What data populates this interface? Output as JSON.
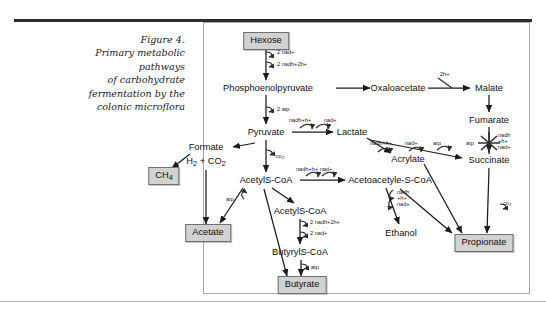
{
  "caption": {
    "figure_label": "Figure 4.",
    "lines": [
      "Figure 4.",
      "Primary metabolic",
      "pathways",
      "of carbohydrate",
      "fermentation by the",
      "colonic microflora"
    ]
  },
  "colors": {
    "box_fill": "#d2d2d2",
    "box_border": "#6f6f6f",
    "arrow": "#1b1b1b",
    "frame_border": "#a9a9a9",
    "top_rule": "#2b2b2b",
    "text": "#111111"
  },
  "diagram": {
    "title": "Primary metabolic pathways of carbohydrate fermentation by the colonic microflora",
    "nodes": [
      {
        "id": "hexose",
        "label": "Hexose",
        "style": "boxed",
        "x": 266,
        "y": 41
      },
      {
        "id": "pep",
        "label": "Phosphoenolpyruvate",
        "style": "plain",
        "x": 268,
        "y": 88
      },
      {
        "id": "oxaloacetate",
        "label": "Oxaloacetate",
        "style": "plain",
        "x": 398,
        "y": 88
      },
      {
        "id": "malate",
        "label": "Malate",
        "style": "plain",
        "x": 489,
        "y": 88
      },
      {
        "id": "fumarate",
        "label": "Fumarate",
        "style": "plain",
        "x": 489,
        "y": 120
      },
      {
        "id": "succinate",
        "label": "Succinate",
        "style": "plain",
        "x": 489,
        "y": 160
      },
      {
        "id": "pyruvate",
        "label": "Pyruvate",
        "style": "plain",
        "x": 266,
        "y": 132
      },
      {
        "id": "lactate",
        "label": "Lactate",
        "style": "plain",
        "x": 352,
        "y": 132
      },
      {
        "id": "acrylate",
        "label": "Acrylate",
        "style": "plain",
        "x": 408,
        "y": 159
      },
      {
        "id": "formate",
        "label": "Formate",
        "style": "plain",
        "x": 206,
        "y": 147
      },
      {
        "id": "h2co2",
        "label": "H2 + CO2",
        "style": "plain",
        "x": 206,
        "y": 160
      },
      {
        "id": "methane",
        "label": "CH4",
        "style": "boxed",
        "x": 164,
        "y": 176
      },
      {
        "id": "acetyl_coa",
        "label": "AcetylS-CoA",
        "style": "plain",
        "x": 266,
        "y": 180
      },
      {
        "id": "acetoacetyl_coa",
        "label": "Acetoacetyle-S-CoA",
        "style": "plain",
        "x": 390,
        "y": 180
      },
      {
        "id": "acetate",
        "label": "Acetate",
        "style": "boxed",
        "x": 208,
        "y": 233
      },
      {
        "id": "acetyl_coa_2",
        "label": "AcetylS-CoA",
        "style": "plain",
        "x": 300,
        "y": 211
      },
      {
        "id": "butyryl_coa",
        "label": "ButyrylS-CoA",
        "style": "plain",
        "x": 300,
        "y": 252
      },
      {
        "id": "butyrate",
        "label": "Butyrate",
        "style": "boxed",
        "x": 302,
        "y": 285
      },
      {
        "id": "ethanol",
        "label": "Ethanol",
        "style": "plain",
        "x": 401,
        "y": 233
      },
      {
        "id": "propionate",
        "label": "Propionate",
        "style": "boxed",
        "x": 484,
        "y": 243
      }
    ],
    "cofactors": [
      {
        "id": "cof-hexose-in",
        "text": "2 nad+",
        "x": 277,
        "y": 52
      },
      {
        "id": "cof-hexose-out",
        "text": "2 nadh+2h+",
        "x": 277,
        "y": 64
      },
      {
        "id": "cof-pep-atp",
        "text": "2 atp",
        "x": 277,
        "y": 110
      },
      {
        "id": "cof-pyr-lac-in",
        "text": "nadh+h+",
        "x": 289,
        "y": 119
      },
      {
        "id": "cof-pyr-lac-out",
        "text": "nad+",
        "x": 322,
        "y": 119
      },
      {
        "id": "cof-pyr-co2",
        "text": "co2",
        "x": 276,
        "y": 156
      },
      {
        "id": "cof-lac-acr-nadh",
        "text": "nadh+h+",
        "x": 374,
        "y": 142
      },
      {
        "id": "cof-lac-acr-nad",
        "text": "nad+",
        "x": 412,
        "y": 142
      },
      {
        "id": "cof-lac-acr-atp",
        "text": "atp",
        "x": 440,
        "y": 142
      },
      {
        "id": "cof-oxa-mal",
        "text": "2h+",
        "x": 443,
        "y": 74
      },
      {
        "id": "cof-fum-nadh",
        "text": "nadh",
        "x": 498,
        "y": 136
      },
      {
        "id": "cof-fum-h",
        "text": "+h+",
        "x": 498,
        "y": 142
      },
      {
        "id": "cof-fum-nad",
        "text": "nad+",
        "x": 498,
        "y": 148
      },
      {
        "id": "cof-fum-atp",
        "text": "atp",
        "x": 468,
        "y": 144
      },
      {
        "id": "cof-suc-co2",
        "text": "co2",
        "x": 500,
        "y": 202
      },
      {
        "id": "cof-acoa-ace-nadh",
        "text": "nadh+h+ nad+",
        "x": 300,
        "y": 168
      },
      {
        "id": "cof-acoa-atp",
        "text": "atp",
        "x": 228,
        "y": 199
      },
      {
        "id": "cof-aacoa-nadh",
        "text": "nadh",
        "x": 400,
        "y": 192
      },
      {
        "id": "cof-aacoa-h",
        "text": "+h+",
        "x": 400,
        "y": 198
      },
      {
        "id": "cof-aacoa-nad",
        "text": "nad+",
        "x": 400,
        "y": 205
      },
      {
        "id": "cof-bu-nadh",
        "text": "2 nadh+2h+",
        "x": 312,
        "y": 224
      },
      {
        "id": "cof-bu-nad",
        "text": "2 nad+",
        "x": 312,
        "y": 235
      },
      {
        "id": "cof-but-atp",
        "text": "atp",
        "x": 313,
        "y": 268
      }
    ],
    "edges": [
      {
        "from": "hexose",
        "to": "pep",
        "kind": "arrow"
      },
      {
        "from": "pep",
        "to": "pyruvate",
        "kind": "arrow"
      },
      {
        "from": "pep",
        "to": "oxaloacetate",
        "kind": "arrow"
      },
      {
        "from": "oxaloacetate",
        "to": "malate",
        "kind": "arrow"
      },
      {
        "from": "malate",
        "to": "fumarate",
        "kind": "arrow"
      },
      {
        "from": "fumarate",
        "to": "succinate",
        "kind": "arrow"
      },
      {
        "from": "succinate",
        "to": "propionate",
        "kind": "arrow"
      },
      {
        "from": "pyruvate",
        "to": "lactate",
        "kind": "arrow"
      },
      {
        "from": "pyruvate",
        "to": "formate",
        "kind": "arrow"
      },
      {
        "from": "pyruvate",
        "to": "acetyl_coa",
        "kind": "arrow"
      },
      {
        "from": "lactate",
        "to": "acrylate",
        "kind": "arrow"
      },
      {
        "from": "lactate",
        "to": "succinate",
        "kind": "arrow"
      },
      {
        "from": "acrylate",
        "to": "propionate",
        "kind": "arrow"
      },
      {
        "from": "formate",
        "to": "methane",
        "kind": "arrow"
      },
      {
        "from": "h2co2",
        "to": "acetate",
        "kind": "arrow"
      },
      {
        "from": "acetyl_coa",
        "to": "acetate",
        "kind": "arrow"
      },
      {
        "from": "acetyl_coa",
        "to": "acetoacetyl_coa",
        "kind": "arrow"
      },
      {
        "from": "acetyl_coa",
        "to": "acetyl_coa_2",
        "kind": "arrow"
      },
      {
        "from": "acetyl_coa",
        "to": "butyrate",
        "kind": "arrow"
      },
      {
        "from": "acetoacetyl_coa",
        "to": "ethanol",
        "kind": "arrow"
      },
      {
        "from": "acetoacetyl_coa",
        "to": "propionate",
        "kind": "arrow"
      },
      {
        "from": "acetyl_coa_2",
        "to": "butyryl_coa",
        "kind": "arrow"
      },
      {
        "from": "butyryl_coa",
        "to": "butyrate",
        "kind": "arrow"
      }
    ],
    "end_products": [
      "CH4",
      "Acetate",
      "Butyrate",
      "Ethanol",
      "Propionate"
    ]
  }
}
